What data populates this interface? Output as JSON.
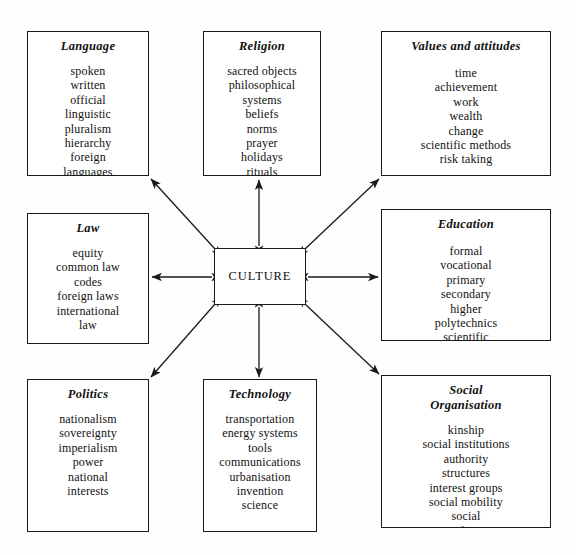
{
  "diagram": {
    "center": {
      "label": "CULTURE"
    },
    "nodes": [
      {
        "id": "language",
        "title": "Language",
        "items": [
          "spoken",
          "written",
          "official",
          "linguistic",
          "pluralism",
          "hierarchy",
          "foreign",
          "languages",
          "mass media"
        ]
      },
      {
        "id": "religion",
        "title": "Religion",
        "items": [
          "sacred objects",
          "philosophical",
          "systems",
          "beliefs",
          "norms",
          "prayer",
          "holidays",
          "rituals",
          "taboos"
        ]
      },
      {
        "id": "values",
        "title": "Values and attitudes",
        "items": [
          "time",
          "achievement",
          "work",
          "wealth",
          "change",
          "scientific methods",
          "risk taking"
        ]
      },
      {
        "id": "law",
        "title": "Law",
        "items": [
          "equity",
          "common law",
          "codes",
          "foreign laws",
          "international",
          "law"
        ]
      },
      {
        "id": "education",
        "title": "Education",
        "items": [
          "formal",
          "vocational",
          "primary",
          "secondary",
          "higher",
          "polytechnics",
          "scientific",
          "literary"
        ]
      },
      {
        "id": "politics",
        "title": "Politics",
        "items": [
          "nationalism",
          "sovereignty",
          "imperialism",
          "power",
          "national",
          "interests"
        ]
      },
      {
        "id": "technology",
        "title": "Technology",
        "items": [
          "transportation",
          "energy systems",
          "tools",
          "communications",
          "urbanisation",
          "invention",
          "science"
        ]
      },
      {
        "id": "social",
        "title": "Social\nOrganisation",
        "items": [
          "kinship",
          "social institutions",
          "authority",
          "structures",
          "interest groups",
          "social mobility",
          "social",
          "satisfaction",
          "status systems"
        ]
      }
    ],
    "connections": [
      {
        "from": "culture",
        "to": "language",
        "style": "double-headed"
      },
      {
        "from": "culture",
        "to": "religion",
        "style": "double-headed"
      },
      {
        "from": "culture",
        "to": "values",
        "style": "double-headed"
      },
      {
        "from": "culture",
        "to": "law",
        "style": "double-headed"
      },
      {
        "from": "culture",
        "to": "education",
        "style": "double-headed"
      },
      {
        "from": "culture",
        "to": "politics",
        "style": "double-headed"
      },
      {
        "from": "culture",
        "to": "technology",
        "style": "double-headed"
      },
      {
        "from": "culture",
        "to": "social",
        "style": "double-headed"
      }
    ],
    "colors": {
      "line": "#1a1a1a",
      "background": "#fefefe",
      "text": "#111111"
    }
  }
}
